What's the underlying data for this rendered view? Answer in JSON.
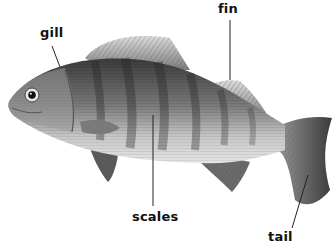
{
  "diagram": {
    "labels": [
      {
        "id": "gill",
        "text": "gill"
      },
      {
        "id": "fin",
        "text": "fin"
      },
      {
        "id": "scales",
        "text": "scales"
      },
      {
        "id": "tail",
        "text": "tail"
      }
    ]
  }
}
